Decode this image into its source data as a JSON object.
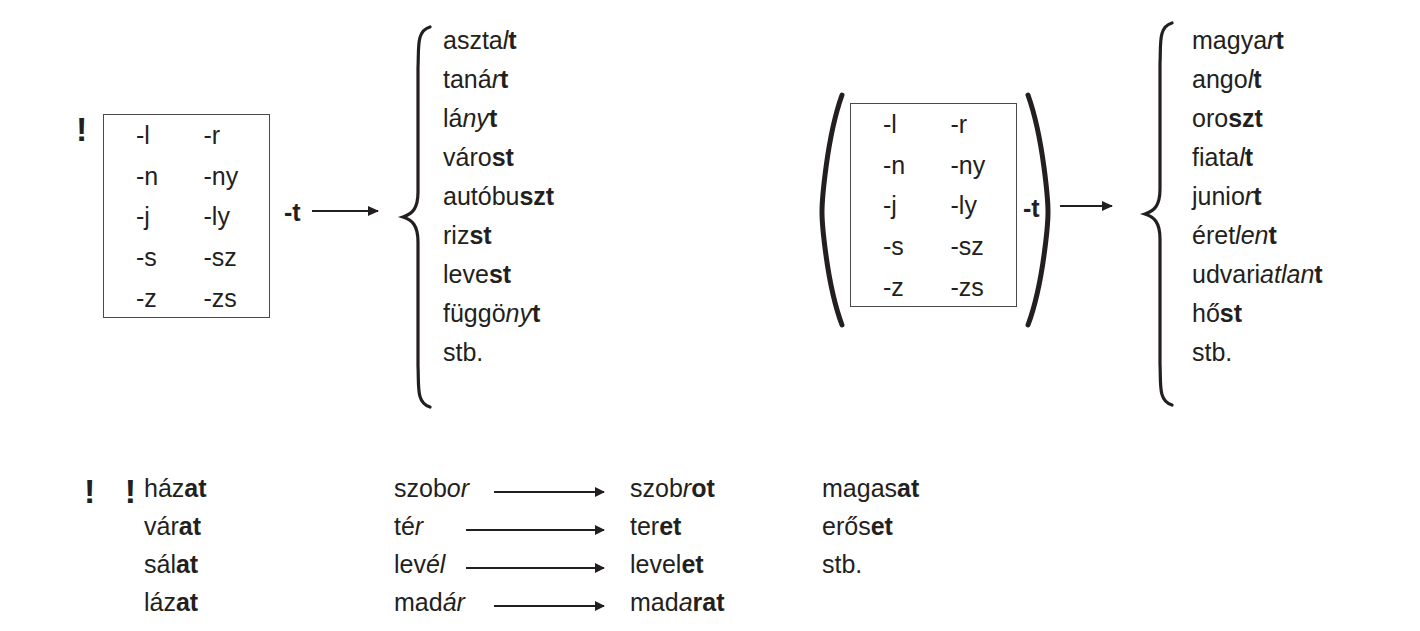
{
  "figure": {
    "kind": "linguistic-rule-diagram",
    "language": "Hungarian",
    "ink_color": "#231f20",
    "rule_marker_single": "!",
    "rule_marker_double": "! !"
  },
  "rule_one": {
    "marker": "!",
    "box": {
      "rows": [
        {
          "left": "-l",
          "right": "-r"
        },
        {
          "left": "-n",
          "right": "-ny"
        },
        {
          "left": "-j",
          "right": "-ly"
        },
        {
          "left": "-s",
          "right": "-sz"
        },
        {
          "left": "-z",
          "right": "-zs"
        }
      ]
    },
    "morpheme": "-t",
    "arrow": "right-arrow",
    "examples": [
      {
        "stem": "aszta",
        "mid": "l",
        "suffix": "t",
        "plain": "asztalt"
      },
      {
        "stem": "taná",
        "mid": "r",
        "suffix": "t",
        "plain": "tanárt"
      },
      {
        "stem": "lá",
        "mid": "ny",
        "suffix": "t",
        "plain": "lányt"
      },
      {
        "stem": "váro",
        "mid": "",
        "suffix": "st",
        "plain": "várost"
      },
      {
        "stem": "autóbu",
        "mid": "",
        "suffix": "szt",
        "plain": "autóbuszt"
      },
      {
        "stem": "riz",
        "mid": "",
        "suffix": "st",
        "plain": "rizst"
      },
      {
        "stem": "leve",
        "mid": "",
        "suffix": "st",
        "plain": "levest"
      },
      {
        "stem": "függö",
        "mid": "ny",
        "suffix": "t",
        "plain": "függönyt"
      },
      {
        "stem": "stb.",
        "mid": "",
        "suffix": "",
        "plain": "stb."
      }
    ]
  },
  "rule_two": {
    "marker": "",
    "paren_open": "(",
    "paren_close": ")",
    "box": {
      "rows": [
        {
          "left": "-l",
          "right": "-r"
        },
        {
          "left": "-n",
          "right": "-ny"
        },
        {
          "left": "-j",
          "right": "-ly"
        },
        {
          "left": "-s",
          "right": "-sz"
        },
        {
          "left": "-z",
          "right": "-zs"
        }
      ]
    },
    "morpheme": "-t",
    "arrow": "right-arrow",
    "examples": [
      {
        "stem": "magya",
        "mid": "r",
        "suffix": "t",
        "plain": "magyart"
      },
      {
        "stem": "ango",
        "mid": "l",
        "suffix": "t",
        "plain": "angolt"
      },
      {
        "stem": "oro",
        "mid": "",
        "suffix": "szt",
        "plain": "oroszt"
      },
      {
        "stem": "fiata",
        "mid": "l",
        "suffix": "t",
        "plain": "fiatalt"
      },
      {
        "stem": "junio",
        "mid": "r",
        "suffix": "t",
        "plain": "juniort"
      },
      {
        "stem": "éret",
        "mid": "len",
        "suffix": "t",
        "plain": "éretlent"
      },
      {
        "stem": "udvari",
        "mid": "atlan",
        "suffix": "t",
        "plain": "udvariatlant"
      },
      {
        "stem": "hő",
        "mid": "",
        "suffix": "st",
        "plain": "hőst"
      },
      {
        "stem": "stb.",
        "mid": "",
        "suffix": "",
        "plain": "stb."
      }
    ]
  },
  "rule_three": {
    "marker": "! !",
    "column_one": [
      {
        "stem": "ház",
        "suffix": "at",
        "plain": "házat"
      },
      {
        "stem": "vár",
        "suffix": "at",
        "plain": "várat"
      },
      {
        "stem": "sál",
        "suffix": "at",
        "plain": "sálat"
      },
      {
        "stem": "láz",
        "suffix": "at",
        "plain": "lázat"
      }
    ],
    "column_two": [
      {
        "from_stem": "szob",
        "from_ital": "or",
        "arrow": "right-arrow",
        "to_stem": "szob",
        "to_ital": "r",
        "to_suffix": "ot",
        "from_plain": "szobor",
        "to_plain": "szobrot"
      },
      {
        "from_stem": "té",
        "from_ital": "r",
        "arrow": "right-arrow",
        "to_stem": "ter",
        "to_ital": "",
        "to_suffix": "et",
        "from_plain": "tér",
        "to_plain": "teret"
      },
      {
        "from_stem": "lev",
        "from_ital": "él",
        "arrow": "right-arrow",
        "to_stem": "level",
        "to_ital": "",
        "to_suffix": "et",
        "from_plain": "levél",
        "to_plain": "levelet"
      },
      {
        "from_stem": "mad",
        "from_ital": "ár",
        "arrow": "right-arrow",
        "to_stem": "mad",
        "to_ital": "a",
        "to_suffix": "rat",
        "from_plain": "madár",
        "to_plain": "madarat"
      }
    ],
    "column_three": [
      {
        "stem": "magas",
        "suffix": "at",
        "plain": "magasat"
      },
      {
        "stem": "erős",
        "suffix": "et",
        "plain": "erőset"
      },
      {
        "stem": "stb.",
        "suffix": "",
        "plain": "stb."
      }
    ]
  }
}
